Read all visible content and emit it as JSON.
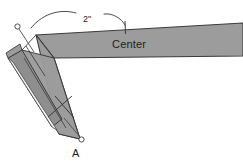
{
  "figure": {
    "background_color": "#ffffff",
    "strap_fill": "#9c9c9c",
    "strap_fill_dark": "#8e8e8e",
    "strap_fill_light": "#f2f2f2",
    "outline_color": "#3b3b3b",
    "leader_color": "#4a4a4a",
    "text_color": "#1d1d1d"
  },
  "labels": {
    "center": "Center",
    "dimension": "2\"",
    "point_a": "A"
  },
  "markers": {
    "upper_endpoint": "circle-marker",
    "lower_endpoint": "circle-marker"
  },
  "annotations": {
    "center_arrow": "curved-arrow-icon",
    "dimension_arc": "curved-arc-icon",
    "fold_tick_upper": "tick-mark",
    "fold_tick_lower": "tick-mark"
  }
}
